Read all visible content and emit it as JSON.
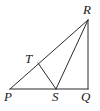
{
  "figure": {
    "kind": "geometry-diagram",
    "stroke_color": "#2b2b2b",
    "background_color": "#ffffff",
    "stroke_width": 1,
    "labels": {
      "P": "P",
      "Q": "Q",
      "R": "R",
      "S": "S",
      "T": "T"
    },
    "points": {
      "P": {
        "x": 10,
        "y": 89
      },
      "Q": {
        "x": 88,
        "y": 89
      },
      "R": {
        "x": 88,
        "y": 20
      },
      "S": {
        "x": 56,
        "y": 89
      },
      "T": {
        "x": 38,
        "y": 63
      }
    },
    "segments": [
      {
        "name": "PQ",
        "from": "P",
        "to": "Q"
      },
      {
        "name": "QR",
        "from": "Q",
        "to": "R"
      },
      {
        "name": "PR",
        "from": "P",
        "to": "R"
      },
      {
        "name": "TS",
        "from": "T",
        "to": "S"
      },
      {
        "name": "SR",
        "from": "S",
        "to": "R"
      }
    ]
  }
}
